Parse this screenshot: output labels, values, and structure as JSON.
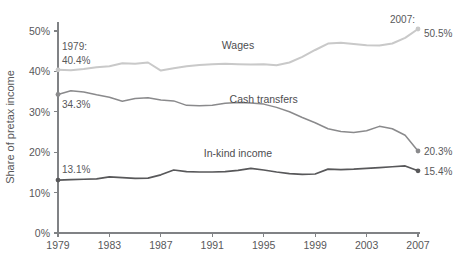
{
  "chart_data": {
    "type": "line",
    "title": "",
    "xlabel": "",
    "ylabel": "Share of pretax income",
    "xlim": [
      1979,
      2007
    ],
    "ylim": [
      0,
      52
    ],
    "grid": false,
    "legend_position": "inline-labels",
    "x_tick_labels": [
      "1979",
      "1983",
      "1987",
      "1991",
      "1995",
      "1999",
      "2003",
      "2007"
    ],
    "x_ticks": [
      1979,
      1983,
      1987,
      1991,
      1995,
      1999,
      2003,
      2007
    ],
    "y_tick_labels": [
      "0%",
      "10%",
      "20%",
      "30%",
      "40%",
      "50%"
    ],
    "y_ticks": [
      0,
      10,
      20,
      30,
      40,
      50
    ],
    "x": [
      1979,
      1980,
      1981,
      1982,
      1983,
      1984,
      1985,
      1986,
      1987,
      1988,
      1989,
      1990,
      1991,
      1992,
      1993,
      1994,
      1995,
      1996,
      1997,
      1998,
      1999,
      2000,
      2001,
      2002,
      2003,
      2004,
      2005,
      2006,
      2007
    ],
    "series": [
      {
        "name": "Wages",
        "color": "#c9c9c9",
        "values": [
          40.4,
          40.3,
          40.6,
          41.0,
          41.3,
          42.0,
          41.9,
          42.2,
          40.2,
          40.8,
          41.3,
          41.6,
          41.8,
          41.9,
          41.8,
          41.7,
          41.8,
          41.5,
          42.2,
          43.6,
          45.3,
          46.9,
          47.1,
          46.8,
          46.5,
          46.4,
          46.9,
          48.3,
          50.5
        ],
        "label_x": 1993,
        "label_y": 45.6,
        "start_annotation": "1979:\n40.4%",
        "end_annotation": "2007:\n50.5%",
        "start_value": 40.4,
        "end_value": 50.5
      },
      {
        "name": "Cash transfers",
        "color": "#8a8a8c",
        "values": [
          34.3,
          35.2,
          34.9,
          34.2,
          33.6,
          32.6,
          33.3,
          33.5,
          32.9,
          32.7,
          31.6,
          31.5,
          31.6,
          32.1,
          32.3,
          32.2,
          31.9,
          31.1,
          30.0,
          28.6,
          27.3,
          25.8,
          25.1,
          24.9,
          25.3,
          26.4,
          25.8,
          24.2,
          20.3
        ],
        "label_x": 1995,
        "label_y": 32.2,
        "end_annotation": "20.3%",
        "start_annotation": "34.3%",
        "start_value": 34.3,
        "end_value": 20.3
      },
      {
        "name": "In-kind income",
        "color": "#58585a",
        "values": [
          13.1,
          13.2,
          13.3,
          13.4,
          13.9,
          13.7,
          13.5,
          13.6,
          14.4,
          15.6,
          15.2,
          15.1,
          15.1,
          15.2,
          15.5,
          16.0,
          15.6,
          15.1,
          14.7,
          14.5,
          14.6,
          15.8,
          15.7,
          15.8,
          16.0,
          16.2,
          16.4,
          16.6,
          15.4
        ],
        "label_x": 1993,
        "label_y": 18.9,
        "start_annotation": "13.1%",
        "end_annotation": "15.4%",
        "start_value": 13.1,
        "end_value": 15.4
      }
    ],
    "annotations": [
      {
        "name": "start-year-label",
        "text": "1979:"
      },
      {
        "name": "start-wages-value",
        "text": "40.4%"
      },
      {
        "name": "end-year-label",
        "text": "2007:"
      },
      {
        "name": "end-wages-value",
        "text": "50.5%"
      },
      {
        "name": "start-cash-value",
        "text": "34.3%"
      },
      {
        "name": "end-cash-value",
        "text": "20.3%"
      },
      {
        "name": "start-inkind-value",
        "text": "13.1%"
      },
      {
        "name": "end-inkind-value",
        "text": "15.4%"
      }
    ]
  }
}
